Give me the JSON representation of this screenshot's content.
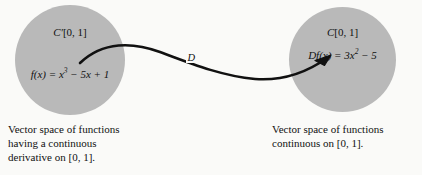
{
  "figure": {
    "background_color": "#fafaf8",
    "circle_color": "#b9b9b9",
    "stroke_color": "#111111"
  },
  "left_set": {
    "space_label_base": "C",
    "space_label_prime": "′",
    "space_label_interval": "[0, 1]",
    "function_text": "f(x) = x",
    "function_exponent": "3",
    "function_rest": " − 5x + 1",
    "caption": "Vector space of functions\nhaving a continuous\nderivative on [0, 1]."
  },
  "right_set": {
    "space_label_base": "C",
    "space_label_interval": "[0, 1]",
    "function_text": "Df(x) = 3x",
    "function_exponent": "2",
    "function_rest": " − 5",
    "caption": "Vector space of functions\ncontinuous on [0, 1]."
  },
  "arrow": {
    "label": "D"
  }
}
